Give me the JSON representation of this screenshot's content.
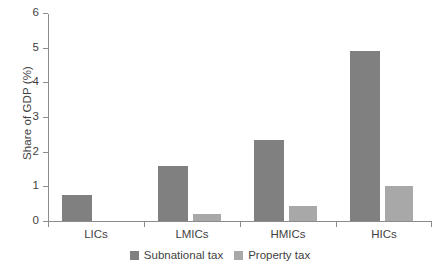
{
  "chart_data": {
    "type": "bar",
    "title": "",
    "xlabel": "",
    "ylabel": "Share of GDP (%)",
    "categories": [
      "LICs",
      "LMICs",
      "HMICs",
      "HICs"
    ],
    "series": [
      {
        "name": "Subnational tax",
        "color": "#808080",
        "values": [
          0.75,
          1.6,
          2.35,
          4.9
        ]
      },
      {
        "name": "Property tax",
        "color": "#a8a8a8",
        "values": [
          0.0,
          0.2,
          0.42,
          1.0
        ]
      }
    ],
    "ylim": [
      0,
      6
    ],
    "yticks": [
      0,
      1,
      2,
      3,
      4,
      5,
      6
    ],
    "ytick_labels": [
      "0",
      "1",
      "2",
      "3",
      "4",
      "5",
      "6"
    ],
    "grid": false,
    "legend_position": "bottom-center"
  },
  "axis": {
    "axis_color": "#8c8c8c"
  }
}
